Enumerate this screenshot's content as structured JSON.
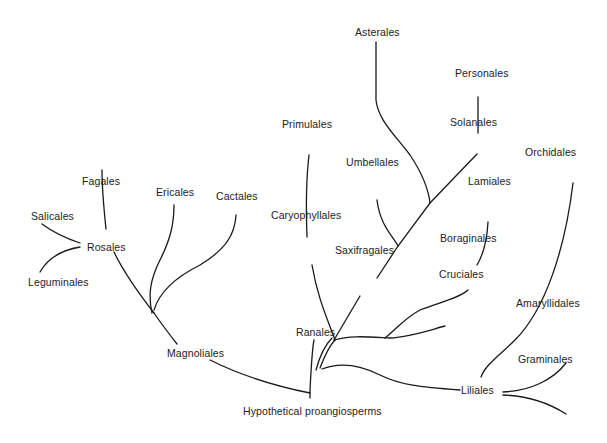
{
  "diagram": {
    "root": "Hypothetical proangiosperms",
    "nodes": {
      "hypothetical_proangiosperms": "Hypothetical proangiosperms",
      "magnoliales": "Magnoliales",
      "ranales": "Ranales",
      "rosales": "Rosales",
      "fagales": "Fagales",
      "salicales": "Salicales",
      "leguminales": "Leguminales",
      "ericales": "Ericales",
      "cactales": "Cactales",
      "primulales": "Primulales",
      "caryophyllales": "Caryophyllales",
      "saxifragales": "Saxifragales",
      "umbellales": "Umbellales",
      "asterales": "Asterales",
      "solanales": "Solanales",
      "personales": "Personales",
      "lamiales": "Lamiales",
      "boraginales": "Boraginales",
      "cruciales": "Cruciales",
      "liliales": "Liliales",
      "orchidales": "Orchidales",
      "amaryllidales": "Amaryllidales",
      "graminales": "Graminales"
    },
    "edges": [
      [
        "Hypothetical proangiosperms",
        "Magnoliales"
      ],
      [
        "Hypothetical proangiosperms",
        "Ranales"
      ],
      [
        "Magnoliales",
        "Rosales"
      ],
      [
        "Magnoliales",
        "Ericales"
      ],
      [
        "Magnoliales",
        "Cactales"
      ],
      [
        "Rosales",
        "Fagales"
      ],
      [
        "Rosales",
        "Salicales"
      ],
      [
        "Rosales",
        "Leguminales"
      ],
      [
        "Ranales",
        "Caryophyllales"
      ],
      [
        "Caryophyllales",
        "Primulales"
      ],
      [
        "Ranales",
        "Saxifragales"
      ],
      [
        "Saxifragales",
        "Umbellales"
      ],
      [
        "Saxifragales",
        "Asterales"
      ],
      [
        "Saxifragales",
        "Solanales"
      ],
      [
        "Solanales",
        "Personales"
      ],
      [
        "Ranales",
        "Boraginales"
      ],
      [
        "Boraginales",
        "Lamiales"
      ],
      [
        "Ranales",
        "Cruciales"
      ],
      [
        "Ranales",
        "Liliales"
      ],
      [
        "Liliales",
        "Orchidales"
      ],
      [
        "Liliales",
        "Amaryllidales"
      ],
      [
        "Liliales",
        "Graminales"
      ]
    ]
  }
}
